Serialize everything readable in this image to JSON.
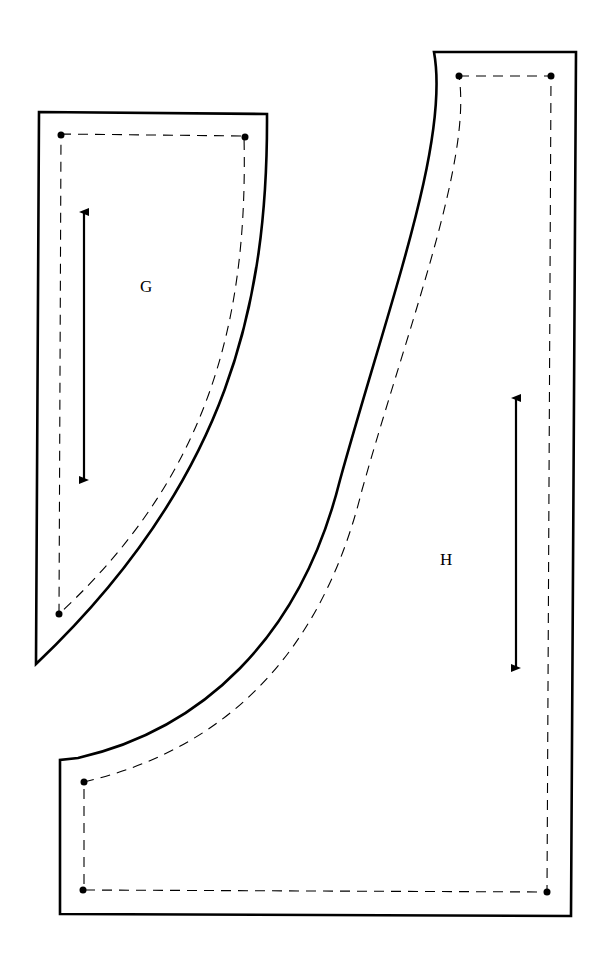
{
  "diagram": {
    "type": "sewing-pattern-pieces",
    "pieces": [
      {
        "id": "G",
        "label": "G"
      },
      {
        "id": "H",
        "label": "H"
      }
    ],
    "colors": {
      "line": "#000000",
      "background": "#ffffff"
    }
  }
}
